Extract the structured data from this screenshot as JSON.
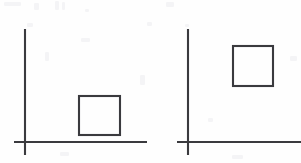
{
  "figure": {
    "background_color": "#fefefe",
    "ink_color": "#3a3a3e",
    "stroke_width": 2.1,
    "width": 301,
    "height": 163,
    "panel_count": 2,
    "description": "Left panel shows a square resting near the horizontal axis; right panel shows an identical square raised high above the horizontal axis."
  },
  "panels": [
    {
      "id": "left-panel",
      "label": "Left panel",
      "vertical_axis": {
        "name": "y-axis",
        "x": 25,
        "y_top": 29,
        "y_bottom": 155
      },
      "horizontal_axis": {
        "name": "x-axis",
        "y": 142,
        "x_left": 14,
        "x_right": 147
      },
      "origin": {
        "x": 25,
        "y": 142
      },
      "square": {
        "name": "square-low",
        "x": 79,
        "y": 96,
        "width": 41,
        "height": 39,
        "position_note": "low, sitting just above the x-axis"
      }
    },
    {
      "id": "right-panel",
      "label": "Right panel",
      "vertical_axis": {
        "name": "y-axis",
        "x": 188,
        "y_top": 29,
        "y_bottom": 155
      },
      "horizontal_axis": {
        "name": "x-axis",
        "y": 142,
        "x_left": 177,
        "x_right": 301
      },
      "origin": {
        "x": 188,
        "y": 142
      },
      "square": {
        "name": "square-high",
        "x": 233,
        "y": 46,
        "width": 40,
        "height": 40,
        "position_note": "high, raised well above the x-axis"
      }
    }
  ],
  "chart_data": {
    "type": "scatter",
    "title": "",
    "xlabel": "",
    "ylabel": "",
    "series": [
      {
        "name": "Left panel square",
        "marker": "square",
        "x": 79,
        "y": 96,
        "width": 41,
        "height": 39,
        "height_above_axis": 7
      },
      {
        "name": "Right panel square",
        "marker": "square",
        "x": 233,
        "y": 46,
        "width": 40,
        "height": 40,
        "height_above_axis": 56
      }
    ],
    "grid": false,
    "legend": "none"
  }
}
